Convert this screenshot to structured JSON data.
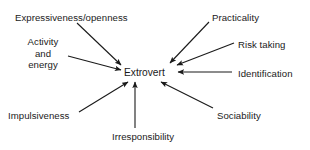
{
  "diagram": {
    "center": {
      "label": "Extrovert",
      "x": 124,
      "y": 67
    },
    "style": {
      "stroke_color": "#1a1a1a",
      "text_color": "#1a1a1a",
      "background_color": "#ffffff",
      "stroke_width": 1.1,
      "arrowhead": "filled-triangle"
    },
    "nodes": [
      {
        "id": "expressiveness-openness",
        "label": "Expressiveness/openness",
        "label_x": 15,
        "label_y": 12,
        "multiline": false,
        "arrow": {
          "x1": 77,
          "y1": 23,
          "x2": 121,
          "y2": 65
        }
      },
      {
        "id": "activity-and-energy",
        "label": "Activity\nand\nenergy",
        "label_x": 22,
        "label_y": 36,
        "label_width": 42,
        "multiline": true,
        "arrow": {
          "x1": 68,
          "y1": 56,
          "x2": 121,
          "y2": 70
        }
      },
      {
        "id": "impulsiveness",
        "label": "Impulsiveness",
        "label_x": 8,
        "label_y": 110,
        "multiline": false,
        "arrow": {
          "x1": 79,
          "y1": 112,
          "x2": 128,
          "y2": 82
        }
      },
      {
        "id": "irresponsibility",
        "label": "Irresponsibility",
        "label_x": 112,
        "label_y": 131,
        "multiline": false,
        "arrow": {
          "x1": 135,
          "y1": 128,
          "x2": 135,
          "y2": 82
        }
      },
      {
        "id": "practicality",
        "label": "Practicality",
        "label_x": 212,
        "label_y": 12,
        "multiline": false,
        "arrow": {
          "x1": 209,
          "y1": 22,
          "x2": 170,
          "y2": 63
        }
      },
      {
        "id": "risk-taking",
        "label": "Risk taking",
        "label_x": 238,
        "label_y": 39,
        "multiline": false,
        "arrow": {
          "x1": 234,
          "y1": 43,
          "x2": 177,
          "y2": 65
        }
      },
      {
        "id": "identification",
        "label": "Identification",
        "label_x": 238,
        "label_y": 68,
        "multiline": false,
        "arrow": {
          "x1": 232,
          "y1": 72,
          "x2": 178,
          "y2": 72
        }
      },
      {
        "id": "sociability",
        "label": "Sociability",
        "label_x": 217,
        "label_y": 110,
        "multiline": false,
        "arrow": {
          "x1": 213,
          "y1": 108,
          "x2": 161,
          "y2": 82
        }
      }
    ]
  }
}
